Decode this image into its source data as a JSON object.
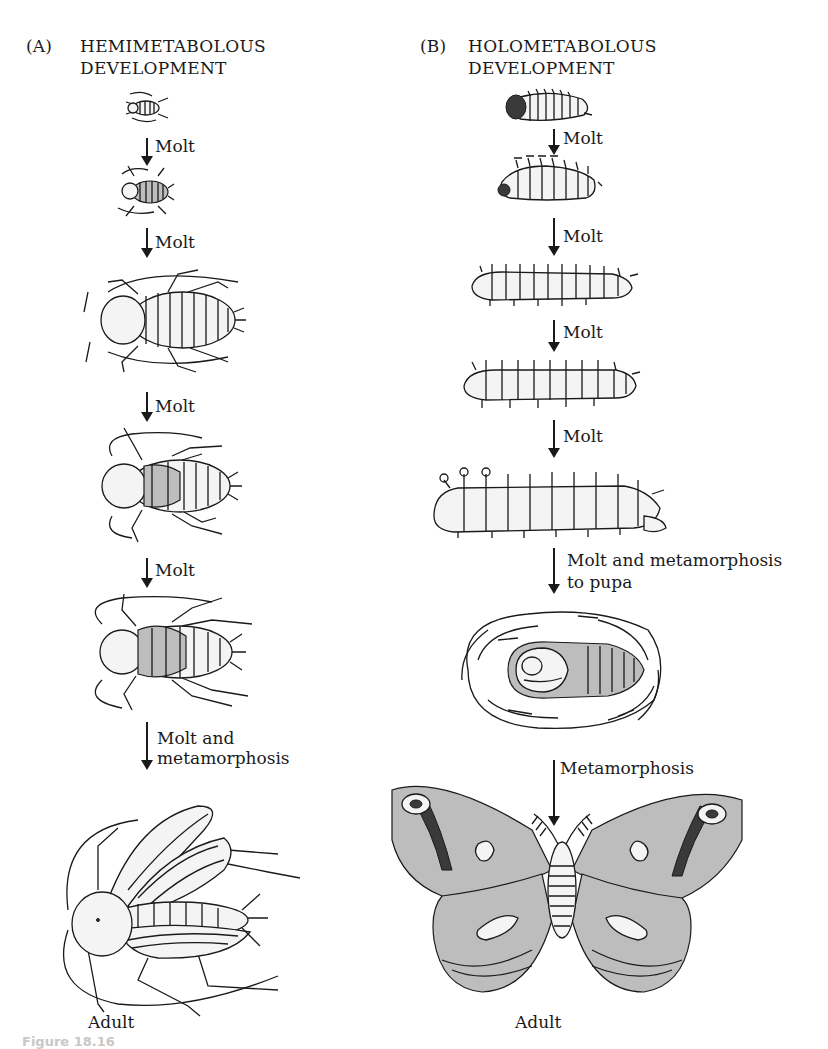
{
  "panel_a": {
    "letter": "(A)",
    "title_line1": "HEMIMETABOLOUS",
    "title_line2": "DEVELOPMENT",
    "steps": [
      {
        "label": "Molt"
      },
      {
        "label": "Molt"
      },
      {
        "label": "Molt"
      },
      {
        "label": "Molt"
      },
      {
        "label_line1": "Molt and",
        "label_line2": "metamorphosis"
      }
    ],
    "stages": [
      "nymph-1",
      "nymph-2",
      "nymph-3",
      "nymph-4",
      "nymph-5",
      "adult-cockroach"
    ],
    "final_label": "Adult"
  },
  "panel_b": {
    "letter": "(B)",
    "title_line1": "HOLOMETABOLOUS",
    "title_line2": "DEVELOPMENT",
    "steps": [
      {
        "label": "Molt"
      },
      {
        "label": "Molt"
      },
      {
        "label": "Molt"
      },
      {
        "label": "Molt"
      },
      {
        "label_line1": "Molt and metamorphosis",
        "label_line2": "to pupa"
      },
      {
        "label": "Metamorphosis"
      }
    ],
    "stages": [
      "larva-1",
      "larva-2",
      "larva-3",
      "larva-4",
      "larva-5",
      "pupa-in-cocoon",
      "adult-moth"
    ],
    "final_label": "Adult"
  },
  "caption": {
    "text": "Figure 18.16"
  }
}
